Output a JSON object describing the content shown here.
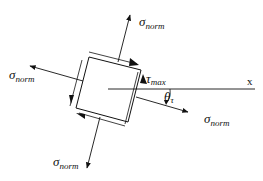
{
  "diagram": {
    "labels": {
      "sigma_top": {
        "symbol": "σ",
        "subscript": "norm"
      },
      "sigma_left": {
        "symbol": "σ",
        "subscript": "norm"
      },
      "sigma_right": {
        "symbol": "σ",
        "subscript": "norm"
      },
      "sigma_bottom": {
        "symbol": "σ",
        "subscript": "norm"
      },
      "tau": {
        "symbol": "τ",
        "subscript": "max"
      },
      "theta": {
        "symbol": "θ",
        "subscript": "τ"
      },
      "x_axis": "x"
    },
    "colors": {
      "stroke": "#111111",
      "background": "#ffffff"
    }
  }
}
